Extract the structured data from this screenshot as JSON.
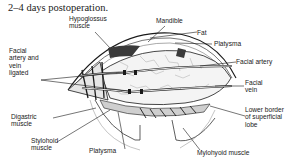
{
  "figure": {
    "caption": "2–4 days postoperation.",
    "labels": {
      "hypoglossus": [
        "Hypoglossus",
        "muscle"
      ],
      "mandible": [
        "Mandible"
      ],
      "fat": [
        "Fat"
      ],
      "platysma_top": [
        "Platysma"
      ],
      "facial_artery_vein_ligated": [
        "Facial",
        "artery and",
        "vein",
        "ligated"
      ],
      "facial_artery": [
        "Facial artery"
      ],
      "facial_vein": [
        "Facial",
        "vein"
      ],
      "digastric": [
        "Digastric",
        "muscle"
      ],
      "lower_border": [
        "Lower border",
        "of superficial",
        "lobe"
      ],
      "stylohoid": [
        "Stylohoid",
        "muscle"
      ],
      "platysma_bottom": [
        "Platysma"
      ],
      "mylohyoid": [
        "Mylohyoid muscle"
      ]
    }
  },
  "colors": {
    "ink": "#1a1a1a",
    "background": "#ffffff",
    "shade": "#4a4a4a"
  }
}
